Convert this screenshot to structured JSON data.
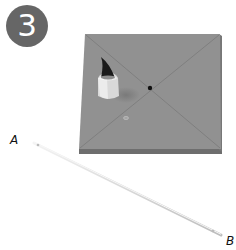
{
  "step": {
    "number": "3"
  },
  "labels": {
    "a": "A",
    "b": "B"
  },
  "colors": {
    "badge": "#666666",
    "board_top": "#8f8f8f",
    "board_edge": "#6e6e6e",
    "stick": "#d8d8d8"
  }
}
